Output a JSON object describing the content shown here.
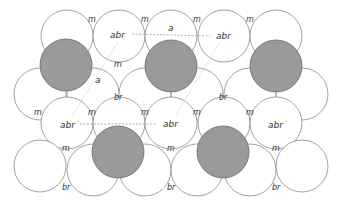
{
  "diagram": {
    "colors": {
      "background": "#ffffff",
      "circle_stroke": "#8a8a8a",
      "circle_fill": "#ffffff",
      "adatom_fill": "#9a9a9a",
      "adatom_stroke": "#6a6a6a",
      "line": "#9a9a9a",
      "text": "#333333"
    },
    "radius": 26,
    "substrate_circles": [
      {
        "x": 67,
        "y": 36
      },
      {
        "x": 119,
        "y": 36
      },
      {
        "x": 171,
        "y": 36
      },
      {
        "x": 224,
        "y": 36
      },
      {
        "x": 276,
        "y": 36
      },
      {
        "x": 40,
        "y": 94
      },
      {
        "x": 93,
        "y": 94
      },
      {
        "x": 145,
        "y": 94
      },
      {
        "x": 197,
        "y": 94
      },
      {
        "x": 250,
        "y": 94
      },
      {
        "x": 302,
        "y": 94
      },
      {
        "x": 67,
        "y": 123
      },
      {
        "x": 119,
        "y": 123
      },
      {
        "x": 171,
        "y": 123
      },
      {
        "x": 224,
        "y": 123
      },
      {
        "x": 276,
        "y": 123
      },
      {
        "x": 40,
        "y": 166
      },
      {
        "x": 93,
        "y": 170
      },
      {
        "x": 145,
        "y": 170
      },
      {
        "x": 197,
        "y": 170
      },
      {
        "x": 250,
        "y": 170
      },
      {
        "x": 302,
        "y": 166
      }
    ],
    "adatoms": [
      {
        "x": 66,
        "y": 65
      },
      {
        "x": 171,
        "y": 66
      },
      {
        "x": 276,
        "y": 66
      },
      {
        "x": 118,
        "y": 152
      },
      {
        "x": 223,
        "y": 152
      }
    ],
    "labels": {
      "abr_top_left": "abr",
      "a_top": "a",
      "abr_top_right": "abr",
      "a_left": "a",
      "abr_mid_left": "abr",
      "abr_mid_center": "abr",
      "abr_mid_right": "abr",
      "m": "m",
      "br": "br"
    },
    "m_sites": [
      {
        "x": 92,
        "y": 19
      },
      {
        "x": 145,
        "y": 19
      },
      {
        "x": 197,
        "y": 19
      },
      {
        "x": 250,
        "y": 19
      },
      {
        "x": 118,
        "y": 64
      },
      {
        "x": 38,
        "y": 112
      },
      {
        "x": 92,
        "y": 112
      },
      {
        "x": 145,
        "y": 112
      },
      {
        "x": 197,
        "y": 112
      },
      {
        "x": 250,
        "y": 112
      },
      {
        "x": 66,
        "y": 148
      },
      {
        "x": 171,
        "y": 148
      },
      {
        "x": 276,
        "y": 148
      }
    ],
    "br_sites": [
      {
        "x": 118,
        "y": 97
      },
      {
        "x": 223,
        "y": 97
      },
      {
        "x": 66,
        "y": 187
      },
      {
        "x": 171,
        "y": 187
      },
      {
        "x": 276,
        "y": 187
      }
    ],
    "dashed_lines": [
      {
        "x1": 132,
        "y1": 34,
        "x2": 210,
        "y2": 36
      },
      {
        "x1": 80,
        "y1": 124,
        "x2": 156,
        "y2": 124
      }
    ],
    "dotted_lines": [
      {
        "x1": 118,
        "y1": 42,
        "x2": 72,
        "y2": 116
      },
      {
        "x1": 220,
        "y1": 42,
        "x2": 175,
        "y2": 116
      }
    ]
  }
}
